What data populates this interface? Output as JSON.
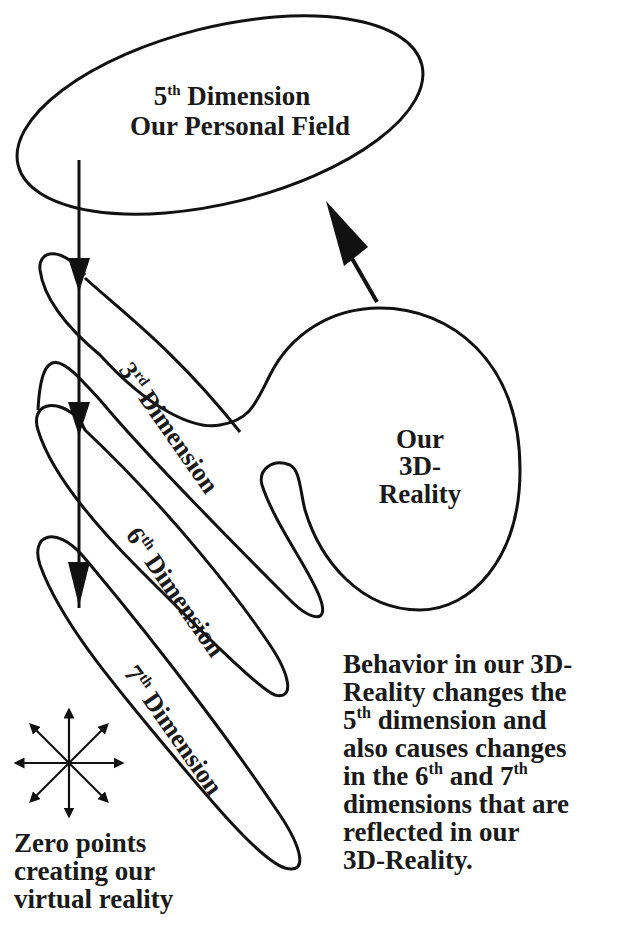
{
  "diagram": {
    "title_ellipse": {
      "line1_num": "5",
      "line1_sup": "th",
      "line1_rest": " Dimension",
      "line2": "Our Personal Field"
    },
    "reality_blob": {
      "line1": "Our",
      "line2": "3D-",
      "line3": "Reality"
    },
    "loops": [
      {
        "num": "3",
        "sup": "rd",
        "label": " Dimension"
      },
      {
        "num": "6",
        "sup": "th",
        "label": " Dimension"
      },
      {
        "num": "7",
        "sup": "th",
        "label": " Dimension"
      }
    ],
    "behavior_note": {
      "l1": "Behavior in our 3D-",
      "l2": "Reality changes the",
      "l3_num": "5",
      "l3_sup": "th",
      "l3_rest": " dimension and",
      "l4": "also causes changes",
      "l5_a": "in the 6",
      "l5_sup1": "th",
      "l5_b": " and 7",
      "l5_sup2": "th",
      "l6": "dimensions that are",
      "l7": "reflected in our",
      "l8": "3D-Reality."
    },
    "zero_points_note": {
      "l1": "Zero points",
      "l2": "creating our",
      "l3": "virtual reality"
    },
    "icons": {
      "star_burst": "eight-direction-arrows-icon",
      "flow_arrow": "down-arrow-icon",
      "feedback_arrow": "up-left-arrow-icon"
    },
    "colors": {
      "ink": "#111111",
      "background": "#ffffff"
    }
  }
}
